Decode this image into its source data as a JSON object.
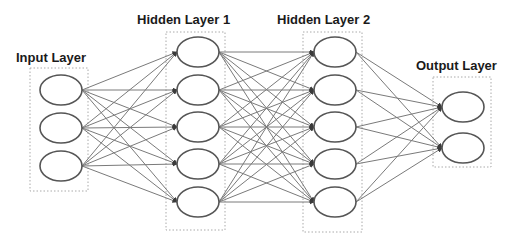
{
  "layers": [
    {
      "name": "Input Layer",
      "nodes": 3
    },
    {
      "name": "Hidden Layer 1",
      "nodes": 5
    },
    {
      "name": "Hidden Layer 2",
      "nodes": 5
    },
    {
      "name": "Output Layer",
      "nodes": 2
    }
  ],
  "labels": {
    "input": "Input Layer",
    "hidden1": "Hidden Layer 1",
    "hidden2": "Hidden Layer 2",
    "output": "Output Layer"
  },
  "colors": {
    "node_stroke": "#555555",
    "edge": "#7a7a7a",
    "arrow": "#3a3a3a",
    "box": "#aaaaaa"
  },
  "connectivity": "fully-connected"
}
